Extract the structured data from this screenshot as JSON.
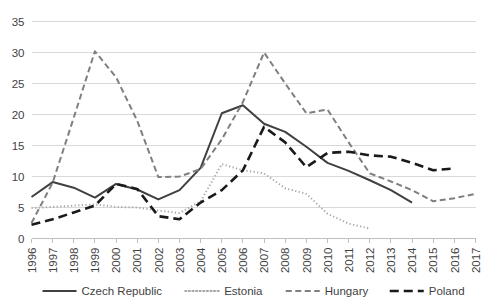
{
  "chart_data": {
    "type": "line",
    "title": "",
    "subtitle": "",
    "xlabel": "",
    "ylabel": "",
    "grid": true,
    "legend_position": "bottom",
    "ylim": [
      0,
      35
    ],
    "ytick_step": 5,
    "ytick_labels": [
      "0",
      "5",
      "10",
      "15",
      "20",
      "25",
      "30",
      "35"
    ],
    "x": [
      1996,
      1997,
      1998,
      1999,
      2000,
      2001,
      2002,
      2003,
      2004,
      2005,
      2006,
      2007,
      2008,
      2009,
      2010,
      2011,
      2012,
      2013,
      2014,
      2015,
      2016,
      2017
    ],
    "xtick_labels": [
      "1996",
      "1997",
      "1998",
      "1999",
      "2000",
      "2001",
      "2002",
      "2003",
      "2004",
      "2005",
      "2006",
      "2007",
      "2008",
      "2009",
      "2010",
      "2011",
      "2012",
      "2013",
      "2014",
      "2015",
      "2016",
      "2017"
    ],
    "series": [
      {
        "name": "Czech Republic",
        "color": "#404040",
        "style": "solid",
        "dasharray": "",
        "width": 2.0,
        "x": [
          1996,
          1997,
          1998,
          1999,
          2000,
          2001,
          2002,
          2003,
          2004,
          2005,
          2006,
          2007,
          2008,
          2009,
          2010,
          2011,
          2012,
          2013,
          2014
        ],
        "values": [
          6.7,
          9.1,
          8.2,
          6.6,
          8.8,
          7.9,
          6.3,
          7.8,
          11.4,
          20.2,
          21.5,
          18.5,
          17.2,
          14.8,
          12.2,
          10.9,
          9.4,
          7.8,
          5.8
        ]
      },
      {
        "name": "Estonia",
        "color": "#a6a6a6",
        "style": "dotted",
        "dasharray": "1.2,2.4",
        "width": 2.0,
        "x": [
          1996,
          1997,
          1998,
          1999,
          2000,
          2001,
          2002,
          2003,
          2004,
          2005,
          2006,
          2007,
          2008,
          2009,
          2010,
          2011,
          2012
        ],
        "values": [
          4.9,
          5.1,
          5.3,
          5.5,
          5.1,
          5.0,
          4.5,
          4.1,
          6.0,
          12.0,
          11.0,
          10.5,
          8.1,
          7.2,
          4.0,
          2.4,
          1.6
        ]
      },
      {
        "name": "Hungary",
        "color": "#7f7f7f",
        "style": "dashed",
        "dasharray": "6,3.5",
        "width": 2.0,
        "x": [
          1996,
          1997,
          1998,
          1999,
          2000,
          2001,
          2002,
          2003,
          2004,
          2005,
          2006,
          2007,
          2008,
          2009,
          2010,
          2011,
          2012,
          2013,
          2014,
          2015,
          2016,
          2017
        ],
        "values": [
          2.5,
          9.0,
          19.5,
          30.2,
          26.0,
          19.0,
          9.9,
          10.0,
          11.2,
          16.0,
          22.0,
          30.0,
          25.0,
          20.2,
          20.8,
          15.5,
          10.5,
          9.2,
          7.8,
          6.0,
          6.5,
          7.2
        ]
      },
      {
        "name": "Poland",
        "color": "#1a1a1a",
        "style": "long-dash",
        "dasharray": "9,5",
        "width": 2.6,
        "x": [
          1996,
          1997,
          1998,
          1999,
          2000,
          2001,
          2002,
          2003,
          2004,
          2005,
          2006,
          2007,
          2008,
          2009,
          2010,
          2011,
          2012,
          2013,
          2014,
          2015,
          2016
        ],
        "values": [
          2.2,
          3.1,
          4.2,
          5.3,
          8.8,
          8.0,
          3.6,
          3.1,
          5.8,
          7.8,
          11.0,
          18.0,
          15.5,
          11.5,
          13.8,
          14.0,
          13.4,
          13.2,
          12.2,
          11.0,
          11.3
        ]
      }
    ],
    "legend": [
      {
        "label": "Czech Republic",
        "color": "#404040",
        "dasharray": "",
        "width": 2.0
      },
      {
        "label": "Estonia",
        "color": "#a6a6a6",
        "dasharray": "1.2,2.4",
        "width": 2.0
      },
      {
        "label": "Hungary",
        "color": "#7f7f7f",
        "dasharray": "6,3.5",
        "width": 2.0
      },
      {
        "label": "Poland",
        "color": "#1a1a1a",
        "dasharray": "9,5",
        "width": 2.6
      }
    ]
  }
}
